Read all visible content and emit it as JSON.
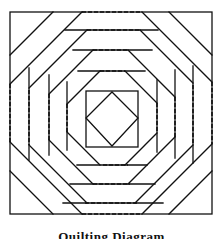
{
  "figure": {
    "type": "quilt-block-line-drawing",
    "pattern": "pineapple log cabin",
    "caption": "Quilting Diagram",
    "line_color": "#111111",
    "background": "#ffffff",
    "line_styles": [
      "solid",
      "dashed (quilting lines)"
    ]
  }
}
